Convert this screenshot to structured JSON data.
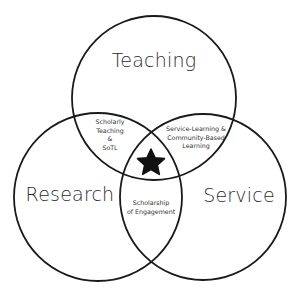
{
  "diagram": {
    "type": "venn",
    "stroke_color": "#1a1a1a",
    "background": "#ffffff",
    "circles": [
      {
        "id": "teaching",
        "label": "Teaching",
        "cx": 154,
        "cy": 98,
        "r": 82
      },
      {
        "id": "research",
        "label": "Research",
        "cx": 98,
        "cy": 197,
        "r": 84
      },
      {
        "id": "service",
        "label": "Service",
        "cx": 203,
        "cy": 197,
        "r": 83
      }
    ],
    "intersections": {
      "teaching_research": [
        "Scholarly",
        "Teaching",
        "&",
        "SoTL"
      ],
      "teaching_service": [
        "Service-Learning  &",
        "Community-Based",
        "Learning"
      ],
      "research_service": [
        "Scholarship",
        "of Engagement"
      ]
    },
    "center_icon": "star-icon"
  }
}
